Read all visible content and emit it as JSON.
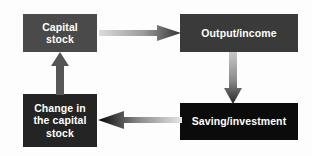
{
  "diagram": {
    "background_color": "#fdfdfd",
    "nodes": [
      {
        "id": "capital-stock",
        "label": "Capital\nstock",
        "fill": "#4a4a4a",
        "text_color": "#ffffff"
      },
      {
        "id": "output-income",
        "label": "Output/income",
        "fill": "#3a3a3a",
        "text_color": "#ffffff"
      },
      {
        "id": "saving-investment",
        "label": "Saving/investment",
        "fill": "#0b0b0b",
        "text_color": "#ffffff"
      },
      {
        "id": "change-in-the-capital-stock",
        "label": "Change in\nthe capital\nstock",
        "fill": "#242424",
        "text_color": "#ffffff"
      }
    ],
    "arrows": [
      {
        "id": "capital-to-output",
        "from": "capital-stock",
        "to": "output-income",
        "direction": "right",
        "gradient_start": "#d8d8d8",
        "gradient_end": "#3c3c3c"
      },
      {
        "id": "output-to-saving",
        "from": "output-income",
        "to": "saving-investment",
        "direction": "down",
        "gradient_start": "#c2c2c2",
        "gradient_end": "#2e2e2e"
      },
      {
        "id": "saving-to-change",
        "from": "saving-investment",
        "to": "change-in-the-capital-stock",
        "direction": "left",
        "gradient_start": "#e2e2e2",
        "gradient_end": "#090909"
      },
      {
        "id": "change-to-capital",
        "from": "change-in-the-capital-stock",
        "to": "capital-stock",
        "direction": "up",
        "gradient_start": "#585858",
        "gradient_end": "#585858"
      }
    ]
  }
}
